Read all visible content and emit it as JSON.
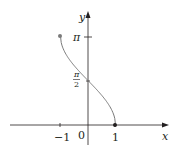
{
  "chart_data": {
    "type": "line",
    "title": "",
    "function": "y = arccos(x)",
    "xlabel": "x",
    "ylabel": "y",
    "x_ticks": [
      {
        "value": -1,
        "label": "−1"
      },
      {
        "value": 0,
        "label": "0"
      },
      {
        "value": 1,
        "label": "1"
      }
    ],
    "y_ticks": [
      {
        "value": 1.5708,
        "label": "π/2"
      },
      {
        "value": 3.1416,
        "label": "π"
      }
    ],
    "xlim": [
      -3,
      3
    ],
    "ylim": [
      -0.7,
      4.0
    ],
    "grid": false,
    "legend": null,
    "series": [
      {
        "name": "arccos(x)",
        "x": [
          -1,
          -0.75,
          -0.5,
          -0.25,
          0,
          0.25,
          0.5,
          0.75,
          1
        ],
        "y": [
          3.1416,
          2.4189,
          2.0944,
          1.8235,
          1.5708,
          1.3181,
          1.0472,
          0.7227,
          0
        ],
        "color": "#7a7a7a"
      }
    ],
    "endpoints": [
      {
        "x": -1,
        "y": 3.1416,
        "style": "filled-dot",
        "color": "#7a7a7a"
      },
      {
        "x": 1,
        "y": 0,
        "style": "filled-dot",
        "color": "#231f20"
      }
    ]
  },
  "labels": {
    "x_axis": "x",
    "y_axis": "y",
    "tick_neg1": "−1",
    "tick_0": "0",
    "tick_1": "1",
    "tick_pi": "π",
    "tick_pi2_num": "π",
    "tick_pi2_den": "2"
  },
  "colors": {
    "axis": "#231f20",
    "curve": "#7a7a7a"
  }
}
